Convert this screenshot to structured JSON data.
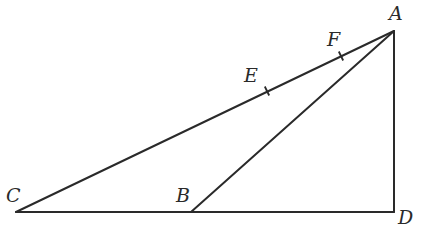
{
  "figure": {
    "type": "geometry-diagram",
    "points": {
      "A": {
        "label": "A",
        "x": 394,
        "y": 31,
        "label_x": 389,
        "label_y": 20
      },
      "B": {
        "label": "B",
        "x": 191,
        "y": 212,
        "label_x": 176,
        "label_y": 202
      },
      "C": {
        "label": "C",
        "x": 16,
        "y": 212,
        "label_x": 6,
        "label_y": 202
      },
      "D": {
        "label": "D",
        "x": 394,
        "y": 212,
        "label_x": 398,
        "label_y": 224
      },
      "E": {
        "label": "E",
        "x": 267,
        "y": 91,
        "label_x": 244,
        "label_y": 82
      },
      "F": {
        "label": "F",
        "x": 341,
        "y": 56,
        "label_x": 327,
        "label_y": 46
      }
    },
    "segments": [
      {
        "from": "C",
        "to": "A"
      },
      {
        "from": "B",
        "to": "A"
      },
      {
        "from": "A",
        "to": "D"
      },
      {
        "from": "C",
        "to": "D"
      }
    ],
    "tick_marks": [
      {
        "on": "E",
        "segment": "CA"
      },
      {
        "on": "F",
        "segment": "CA"
      }
    ],
    "right_angle_at": "D",
    "colors": {
      "stroke": "#2a2a2a",
      "background": "#ffffff"
    }
  }
}
